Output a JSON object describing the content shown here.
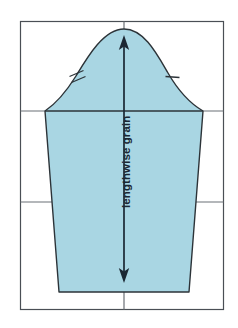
{
  "figure": {
    "kind": "sewing-pattern-diagram",
    "background_color": "#ffffff",
    "frame": {
      "name": "outer-frame",
      "stroke": "#4a4f55",
      "stroke_width": 1.2,
      "x": 20,
      "y": 21,
      "width": 204,
      "height": 289
    },
    "grid": {
      "stroke": "#6b7076",
      "stroke_width": 1.2,
      "vertical_lines_x": [
        124
      ],
      "horizontal_lines_y": [
        111,
        202
      ],
      "note": "straight-edge guide lines crossing the whole frame"
    },
    "pattern_piece": {
      "name": "sleeve-pattern-piece",
      "fill_color": "#a9d6e3",
      "stroke_color": "#2c3338",
      "stroke_width": 1.4,
      "peak": {
        "x": 124,
        "y": 29
      },
      "left_shoulder": {
        "x": 45,
        "y": 111
      },
      "right_shoulder": {
        "x": 203,
        "y": 111
      },
      "hem_left": {
        "x": 59,
        "y": 292
      },
      "hem_right": {
        "x": 189,
        "y": 292
      }
    },
    "grain_line": {
      "name": "lengthwise-grain-line",
      "label": "lengthwise grain",
      "stroke": "#1b2733",
      "stroke_width": 1.6,
      "x": 124,
      "top_y": 38,
      "bottom_y": 281,
      "arrow_top": "up",
      "arrow_bottom": "down"
    },
    "notches": [
      {
        "name": "double-notch-front",
        "side": "left",
        "count": 2,
        "x": 76,
        "y": 76,
        "stroke": "#2c3338"
      },
      {
        "name": "single-notch-back",
        "side": "right",
        "count": 1,
        "x": 172,
        "y": 77,
        "stroke": "#2c3338"
      }
    ],
    "caption": {
      "text": "",
      "visible": false
    }
  },
  "labels": {
    "grain_text": "lengthwise grain"
  }
}
